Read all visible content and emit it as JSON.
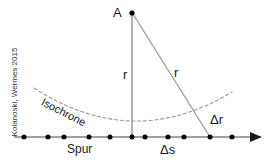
{
  "figure": {
    "background_color": "#ffffff",
    "line_color": "#808080",
    "axis_color": "#808080",
    "dot_color": "#000000",
    "text_color": "#1a1a1a",
    "dashed_curve_color": "#999999",
    "credit": "Kolanoski, Wermes 2015"
  },
  "labels": {
    "apex": "A",
    "radius_vertical": "r",
    "radius_slanted": "r",
    "delta_r": "Δr",
    "delta_s": "Δs",
    "track": "Spur",
    "isochrone": "Isochrone"
  },
  "geometry": {
    "apex_point": {
      "x": 132,
      "y": 13
    },
    "vertical_foot": {
      "x": 132,
      "y": 137
    },
    "slant_foot": {
      "x": 210,
      "y": 137
    },
    "axis_y": 137,
    "axis_start_x": 14,
    "axis_end_x": 262,
    "axis_arrow_tip_x": 262,
    "wire_dots_x": [
      24,
      48,
      64,
      89,
      110,
      132,
      145,
      168,
      184,
      210,
      232
    ],
    "isochrone_curve": {
      "type": "parabola",
      "left_end": {
        "x": 34,
        "y": 88
      },
      "vertex": {
        "x": 133,
        "y": 140
      },
      "right_end": {
        "x": 232,
        "y": 92
      }
    }
  }
}
